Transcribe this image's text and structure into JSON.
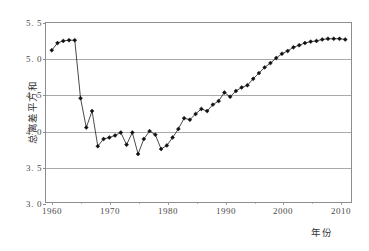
{
  "chart_data": {
    "type": "line",
    "title": "",
    "subtitle": "",
    "xlabel": "年份",
    "ylabel": "总离差平方和",
    "xlim": [
      1959,
      2012
    ],
    "ylim": [
      3.0,
      5.5
    ],
    "grid": "horizontal",
    "legend": "none",
    "marker": "filled-diamond",
    "line_color": "#1a1a1a",
    "marker_color": "#111111",
    "grid_color": "#a9a9a9",
    "frame_color": "#8d8d8d",
    "background": "#ffffff",
    "xticks": [
      1960,
      1970,
      1980,
      1990,
      2000,
      2010
    ],
    "xtick_labels": [
      "1960",
      "1970",
      "1980",
      "1990",
      "2000",
      "2010"
    ],
    "xminor_ticks": [
      1965,
      1975,
      1985,
      1995,
      2005
    ],
    "yticks": [
      3.0,
      3.5,
      4.0,
      4.5,
      5.0,
      5.5
    ],
    "ytick_labels": [
      "3. 0",
      "3. 5",
      "4. 0",
      "4. 5",
      "5. 0",
      "5. 5"
    ],
    "x": [
      1960,
      1961,
      1962,
      1963,
      1964,
      1965,
      1966,
      1967,
      1968,
      1969,
      1970,
      1971,
      1972,
      1973,
      1974,
      1975,
      1976,
      1977,
      1978,
      1979,
      1980,
      1981,
      1982,
      1983,
      1984,
      1985,
      1986,
      1987,
      1988,
      1989,
      1990,
      1991,
      1992,
      1993,
      1994,
      1995,
      1996,
      1997,
      1998,
      1999,
      2000,
      2001,
      2002,
      2003,
      2004,
      2005,
      2006,
      2007,
      2008,
      2009,
      2010,
      2011
    ],
    "values": [
      5.12,
      5.22,
      5.25,
      5.26,
      5.26,
      4.45,
      4.04,
      4.27,
      3.78,
      3.88,
      3.9,
      3.93,
      3.97,
      3.8,
      3.97,
      3.67,
      3.88,
      3.99,
      3.94,
      3.74,
      3.79,
      3.9,
      4.02,
      4.17,
      4.15,
      4.23,
      4.3,
      4.27,
      4.36,
      4.41,
      4.53,
      4.47,
      4.55,
      4.6,
      4.63,
      4.72,
      4.8,
      4.88,
      4.94,
      5.01,
      5.07,
      5.11,
      5.16,
      5.19,
      5.22,
      5.24,
      5.25,
      5.27,
      5.28,
      5.28,
      5.28,
      5.27
    ],
    "series": [
      {
        "name": "总离差平方和",
        "values": [
          5.12,
          5.22,
          5.25,
          5.26,
          5.26,
          4.45,
          4.04,
          4.27,
          3.78,
          3.88,
          3.9,
          3.93,
          3.97,
          3.8,
          3.97,
          3.67,
          3.88,
          3.99,
          3.94,
          3.74,
          3.79,
          3.9,
          4.02,
          4.17,
          4.15,
          4.23,
          4.3,
          4.27,
          4.36,
          4.41,
          4.53,
          4.47,
          4.55,
          4.6,
          4.63,
          4.72,
          4.8,
          4.88,
          4.94,
          5.01,
          5.07,
          5.11,
          5.16,
          5.19,
          5.22,
          5.24,
          5.25,
          5.27,
          5.28,
          5.28,
          5.28,
          5.27
        ]
      }
    ]
  }
}
